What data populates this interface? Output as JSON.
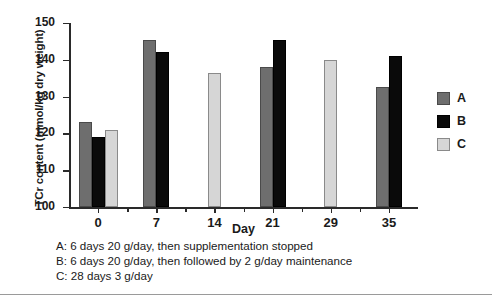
{
  "chart_data": {
    "type": "bar",
    "title": "",
    "xlabel": "Day",
    "ylabel": "TCr content (mmol/kg dry weight)",
    "ylim": [
      100,
      150
    ],
    "yticks": [
      100,
      110,
      120,
      130,
      140,
      150
    ],
    "categories": [
      "0",
      "7",
      "14",
      "21",
      "29",
      "35"
    ],
    "grid": false,
    "legend_position": "right",
    "series": [
      {
        "name": "A",
        "color": "#6e6e6e",
        "values": [
          123,
          145.5,
          null,
          138,
          null,
          132.5
        ]
      },
      {
        "name": "B",
        "color": "#0a0a0a",
        "values": [
          119,
          142,
          null,
          145.5,
          null,
          141
        ]
      },
      {
        "name": "C",
        "color": "#d6d6d6",
        "values": [
          121,
          null,
          136.5,
          null,
          140,
          null
        ]
      }
    ]
  },
  "legend": {
    "entries": [
      {
        "label": "A",
        "color": "#6e6e6e"
      },
      {
        "label": "B",
        "color": "#0a0a0a"
      },
      {
        "label": "C",
        "color": "#d6d6d6"
      }
    ]
  },
  "caption": {
    "lines": [
      "A: 6 days 20 g/day, then supplementation stopped",
      "B: 6 days 20 g/day, then followed by 2 g/day maintenance",
      "C: 28 days 3 g/day"
    ]
  }
}
